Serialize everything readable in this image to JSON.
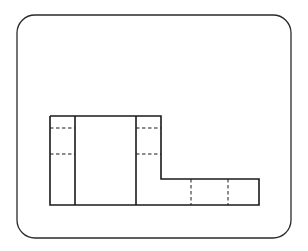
{
  "diagram": {
    "type": "orthographic-projection-view",
    "frame": {
      "x": 17,
      "y": 15,
      "width": 274,
      "height": 223,
      "radius": 18,
      "stroke": "#2a2a2a"
    },
    "stroke_color": "#1a1a1a",
    "outline": [
      [
        50,
        116
      ],
      [
        161,
        116
      ],
      [
        161,
        179
      ],
      [
        259,
        179
      ],
      [
        259,
        205
      ],
      [
        50,
        205
      ],
      [
        50,
        116
      ]
    ],
    "solid_lines": [
      {
        "x1": 75,
        "y1": 116,
        "x2": 75,
        "y2": 205
      },
      {
        "x1": 136,
        "y1": 116,
        "x2": 136,
        "y2": 205
      }
    ],
    "hidden_lines": [
      {
        "x1": 50,
        "y1": 128,
        "x2": 75,
        "y2": 128
      },
      {
        "x1": 50,
        "y1": 154,
        "x2": 75,
        "y2": 154
      },
      {
        "x1": 136,
        "y1": 128,
        "x2": 161,
        "y2": 128
      },
      {
        "x1": 136,
        "y1": 154,
        "x2": 161,
        "y2": 154
      },
      {
        "x1": 191,
        "y1": 179,
        "x2": 191,
        "y2": 205
      },
      {
        "x1": 228,
        "y1": 179,
        "x2": 228,
        "y2": 205
      }
    ]
  }
}
